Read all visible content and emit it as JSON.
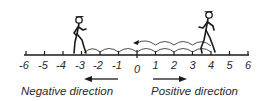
{
  "diagram": {
    "type": "number-line",
    "axis": {
      "min": -6,
      "max": 6,
      "ticks": [
        {
          "value": -6,
          "label": "-6"
        },
        {
          "value": -5,
          "label": "-5"
        },
        {
          "value": -4,
          "label": "-4"
        },
        {
          "value": -3,
          "label": "-3"
        },
        {
          "value": -2,
          "label": "-2"
        },
        {
          "value": -1,
          "label": "-1"
        },
        {
          "value": 0,
          "label": "0"
        },
        {
          "value": 1,
          "label": "1"
        },
        {
          "value": 2,
          "label": "2"
        },
        {
          "value": 3,
          "label": "3"
        },
        {
          "value": 4,
          "label": "4"
        },
        {
          "value": 5,
          "label": "5"
        },
        {
          "value": 6,
          "label": "6"
        }
      ]
    },
    "figures": [
      {
        "name": "walker-left",
        "position": -3,
        "facing": "right"
      },
      {
        "name": "walker-right",
        "position": 4,
        "facing": "right"
      }
    ],
    "hops": [
      {
        "name": "lower-hops",
        "from": -3,
        "to": 4,
        "count": 7
      },
      {
        "name": "upper-hops",
        "from": 4,
        "to": 0,
        "count": 4,
        "arrowhead": "left"
      }
    ],
    "directions": {
      "negative": {
        "label": "Negative direction",
        "arrow": "left"
      },
      "positive": {
        "label": "Positive direction",
        "arrow": "right"
      }
    },
    "colors": {
      "ink": "#1a1a1a",
      "background": "#ffffff"
    }
  }
}
